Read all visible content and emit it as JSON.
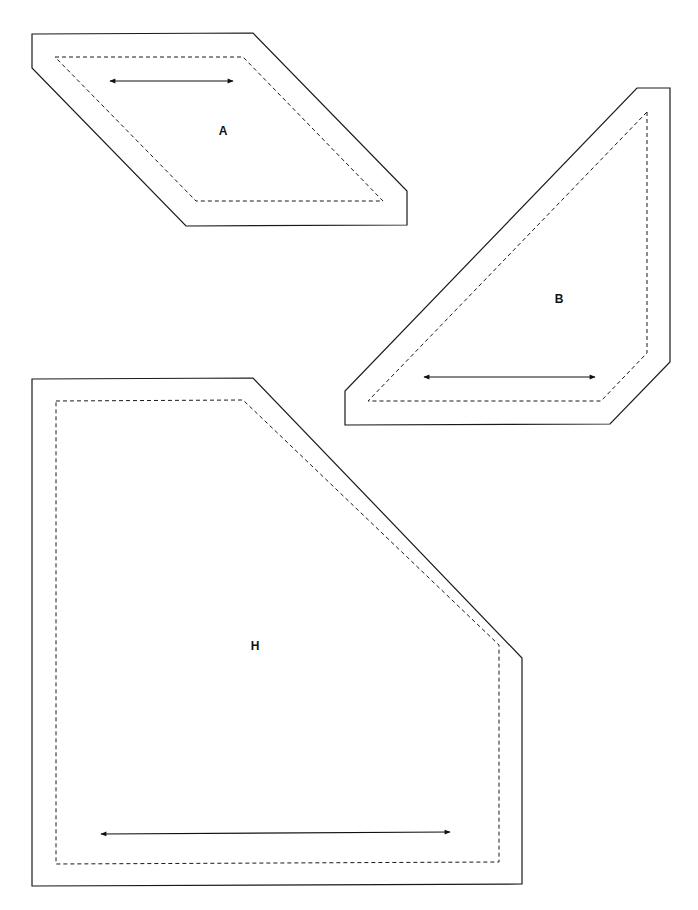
{
  "page": {
    "background": "#ffffff",
    "line_color": "#1a1a1a"
  },
  "pieces": [
    {
      "id": "A",
      "label": "A",
      "outer_points": "32,34 253,33 407,191 407,225 186,226 32,68",
      "inner_points": "55,57 243,57 383,201 196,201",
      "label_pos": [
        223,
        135
      ],
      "arrow": {
        "x1": 110,
        "y1": 81,
        "x2": 233,
        "y2": 81
      }
    },
    {
      "id": "B",
      "label": "B",
      "outer_points": "637,88 670,88 670,362 610,424 345,425 345,391",
      "inner_points": "647,112 647,353 601,401 368,401",
      "label_pos": [
        559,
        303
      ],
      "arrow": {
        "x1": 424,
        "y1": 377,
        "x2": 595,
        "y2": 377
      }
    },
    {
      "id": "H",
      "label": "H",
      "outer_points": "32,379 253,378 522,658 522,884 32,886",
      "inner_points": "56,401 243,400 499,645 499,862 56,864",
      "label_pos": [
        255,
        650
      ],
      "arrow": {
        "x1": 101,
        "y1": 834,
        "x2": 450,
        "y2": 832
      }
    }
  ]
}
